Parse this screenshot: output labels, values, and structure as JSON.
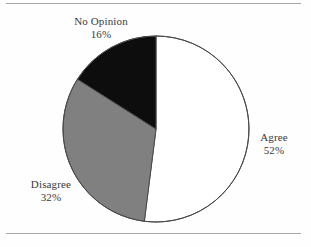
{
  "figure": {
    "background_color": "#fefefe",
    "rule_color": "#a9a9a9",
    "outline_color": "#4a4a4a",
    "label_color": "#3a3a3a"
  },
  "chart_data": {
    "type": "pie",
    "title": "",
    "xlabel": "",
    "ylabel": "",
    "legend_position": "none",
    "grid": false,
    "labels_outside": true,
    "start_angle_deg": 0,
    "direction": "clockwise",
    "categories": [
      "Agree",
      "Disagree",
      "No Opinion"
    ],
    "values": [
      52,
      32,
      16
    ],
    "unit": "%",
    "colors": [
      "#ffffff",
      "#808080",
      "#0d0d0d"
    ],
    "slices": [
      {
        "name": "Agree",
        "value": 52,
        "value_label": "52%",
        "color": "#ffffff",
        "start_angle_deg": 0,
        "end_angle_deg": 187.2
      },
      {
        "name": "Disagree",
        "value": 32,
        "value_label": "32%",
        "color": "#808080",
        "start_angle_deg": 187.2,
        "end_angle_deg": 302.4
      },
      {
        "name": "No Opinion",
        "value": 16,
        "value_label": "16%",
        "color": "#0d0d0d",
        "start_angle_deg": 302.4,
        "end_angle_deg": 360
      }
    ]
  }
}
